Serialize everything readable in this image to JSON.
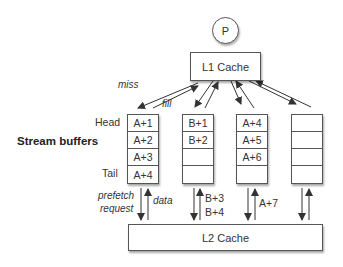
{
  "processor": {
    "label": "P"
  },
  "l1_cache": {
    "label": "L1 Cache"
  },
  "l2_cache": {
    "label": "L2 Cache"
  },
  "section_label": "Stream buffers",
  "row_labels": {
    "head": "Head",
    "tail": "Tail"
  },
  "edge_labels": {
    "miss": "miss",
    "fill": "fill",
    "prefetch_request_line1": "prefetch",
    "prefetch_request_line2": "request",
    "data": "data",
    "b3": "B+3",
    "b4": "B+4",
    "a7": "A+7"
  },
  "buffers": [
    {
      "cells": [
        "A+1",
        "A+2",
        "A+3",
        "A+4"
      ]
    },
    {
      "cells": [
        "B+1",
        "B+2",
        "",
        ""
      ]
    },
    {
      "cells": [
        "A+4",
        "A+5",
        "A+6",
        ""
      ]
    },
    {
      "cells": [
        "",
        "",
        "",
        ""
      ]
    }
  ],
  "colors": {
    "stroke": "#333333",
    "box_border": "#555555",
    "background": "#ffffff"
  }
}
